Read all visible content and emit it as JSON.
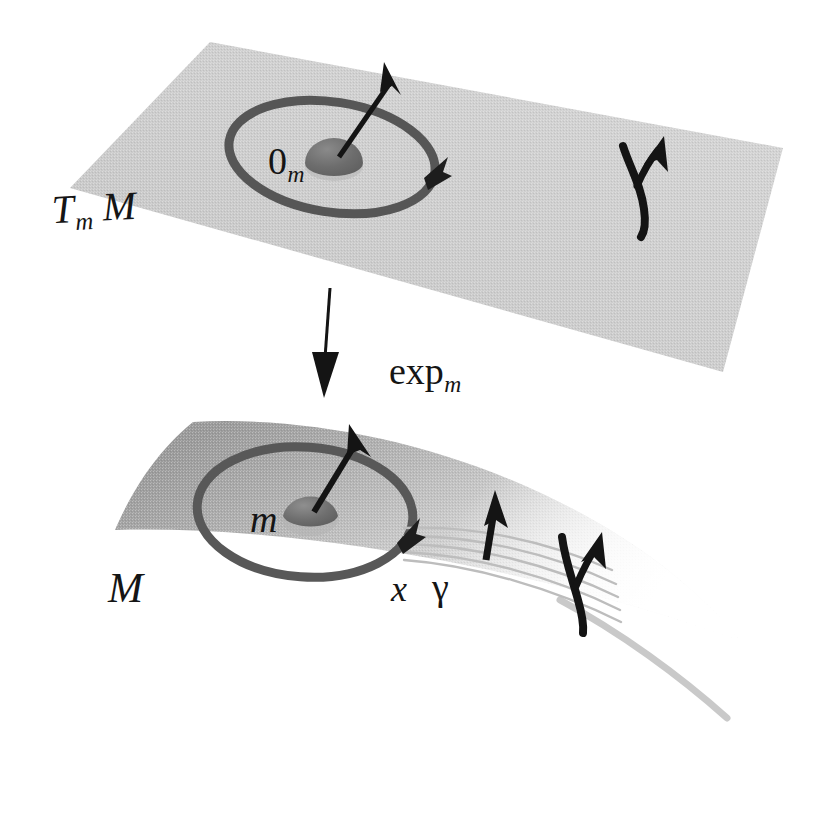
{
  "figure": {
    "background_color": "#ffffff",
    "width": 825,
    "height": 814
  },
  "palette": {
    "plane_fill_light": "#d2d2d2",
    "plane_fill_dark": "#a9a9a9",
    "manifold_fill_dark": "#a0a0a0",
    "manifold_fill_light": "#fdfdfd",
    "circle_stroke": "#585858",
    "dot_fill": "#6f6f6f",
    "ink": "#141414",
    "geodesic_stroke": "#b9b9b9"
  },
  "tangent_plane": {
    "name": "tangent space",
    "label": "T",
    "label_subscript": "m",
    "label_manifold": "M",
    "label_full": "T_m M",
    "origin_label": "0",
    "origin_subscript": "m",
    "origin_label_full": "0_m",
    "vector_label": "γ"
  },
  "map_arrow": {
    "label": "exp",
    "label_subscript": "m",
    "label_full": "exp_m",
    "direction": "down"
  },
  "manifold": {
    "name": "manifold",
    "label": "M",
    "point_label": "m",
    "image_point_label": "x",
    "geodesic_label": "γ",
    "geodesic_line_count": 5
  }
}
